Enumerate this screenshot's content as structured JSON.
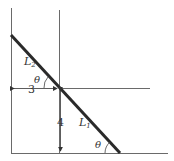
{
  "diagram": {
    "colors": {
      "line": "#6a6a6a",
      "thick_line": "#2a2a2a",
      "text": "#333333"
    },
    "labels": {
      "line_upper": "L",
      "line_upper_sub": "2",
      "line_lower": "L",
      "line_lower_sub": "1",
      "angle_upper": "θ",
      "angle_lower": "θ",
      "horizontal_distance": "3",
      "vertical_distance": "4"
    }
  }
}
